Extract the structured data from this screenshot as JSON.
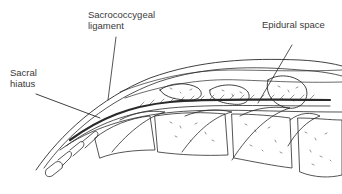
{
  "diagram": {
    "labels": {
      "sacrococcygeal_ligament": "Sacrococcygeal\nligament",
      "sacral_hiatus": "Sacral\nhiatus",
      "epidural_space": "Epidural space"
    },
    "colors": {
      "ink": "#2a2a2a",
      "label_text": "#3a3a3a",
      "background": "#ffffff"
    }
  }
}
